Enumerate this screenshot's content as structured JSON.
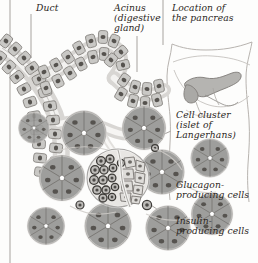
{
  "figure": {
    "background_color": "#fdfdfc",
    "label_color": "#2b2622",
    "line_color": "#8e8a85",
    "cell_fill": "#9e9e9c",
    "cell_fill_light": "#c9c8c5",
    "nucleus_color": "#56534f",
    "islet_dark_cell": "#4c4a47",
    "lumen_color": "#ffffff"
  },
  "labels": {
    "duct": "Duct",
    "acinus_line1": "Acinus",
    "acinus_line2": "(digestive",
    "acinus_line3": "gland)",
    "location_line1": "Location of",
    "location_line2": "the pancreas",
    "islet_line1": "Cell cluster",
    "islet_line2": "(islet of",
    "islet_line3": "Langerhans)",
    "glucagon_line1": "Glucagon-",
    "glucagon_line2": "producing cells",
    "insulin_line1": "Insulin-",
    "insulin_line2": "producing cells"
  },
  "inset": {
    "title_line1": "Location of",
    "title_line2": "the pancreas",
    "organ": "pancreas",
    "organ_fill": "#b5b4b1"
  },
  "structures": {
    "duct_name": "pancreatic-duct",
    "acinus_name": "acinus-digestive-gland",
    "islet_name": "islet-of-langerhans",
    "glucagon_cells": "alpha-cells",
    "insulin_cells": "beta-cells"
  }
}
